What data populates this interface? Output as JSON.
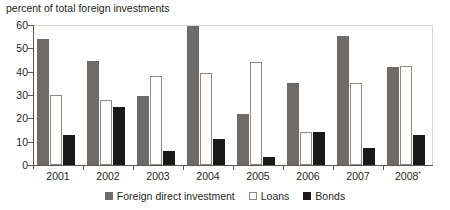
{
  "chart_data": {
    "type": "bar",
    "title": "percent of total foreign investments",
    "xlabel": "",
    "ylabel": "",
    "ylim": [
      0,
      60
    ],
    "yticks": [
      0,
      10,
      20,
      30,
      40,
      50,
      60
    ],
    "grid": false,
    "legend_position": "bottom",
    "categories": [
      "2001",
      "2002",
      "2003",
      "2004",
      "2005",
      "2006",
      "2007",
      "2008*"
    ],
    "series": [
      {
        "name": "Foreign direct investment",
        "color": "#6e6b68",
        "values": [
          54,
          44.5,
          29.5,
          59.5,
          22,
          35,
          55.5,
          42
        ]
      },
      {
        "name": "Loans",
        "color": "#ffffff",
        "values": [
          30,
          28,
          38,
          39.5,
          44,
          14,
          35,
          42.5
        ]
      },
      {
        "name": "Bonds",
        "color": "#1a1a1a",
        "values": [
          13,
          25,
          6,
          11,
          3.5,
          14,
          7.5,
          13
        ]
      }
    ]
  },
  "axis": {
    "y_tick_labels": [
      "60",
      "50",
      "40",
      "30",
      "20",
      "10",
      "0"
    ],
    "x_tick_labels": [
      "2001",
      "2002",
      "2003",
      "2004",
      "2005",
      "2006",
      "2007",
      "2008"
    ],
    "x_last_label_marker": "*"
  },
  "legend": {
    "items": [
      {
        "label": "Foreign direct investment",
        "swatch": "fdi"
      },
      {
        "label": "Loans",
        "swatch": "loans"
      },
      {
        "label": "Bonds",
        "swatch": "bonds"
      }
    ]
  }
}
